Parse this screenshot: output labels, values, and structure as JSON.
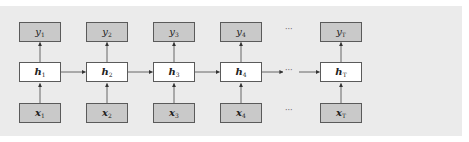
{
  "diagram": {
    "columns": [
      {
        "y": {
          "base": "y",
          "sub": "1"
        },
        "h": {
          "base": "h",
          "sub": "1"
        },
        "x": {
          "base": "x",
          "sub": "1"
        }
      },
      {
        "y": {
          "base": "y",
          "sub": "2"
        },
        "h": {
          "base": "h",
          "sub": "2"
        },
        "x": {
          "base": "x",
          "sub": "2"
        }
      },
      {
        "y": {
          "base": "y",
          "sub": "3"
        },
        "h": {
          "base": "h",
          "sub": "3"
        },
        "x": {
          "base": "x",
          "sub": "3"
        }
      },
      {
        "y": {
          "base": "y",
          "sub": "4"
        },
        "h": {
          "base": "h",
          "sub": "4"
        },
        "x": {
          "base": "x",
          "sub": "4"
        }
      },
      {
        "y": {
          "base": "y",
          "sub": "T"
        },
        "h": {
          "base": "h",
          "sub": "T"
        },
        "x": {
          "base": "x",
          "sub": "T"
        }
      }
    ],
    "ellipsis": "···",
    "colors": {
      "panel": "#ebebeb",
      "io_box": "#c9c9c9",
      "hidden_box": "#ffffff",
      "border": "#5a5a5a"
    }
  }
}
